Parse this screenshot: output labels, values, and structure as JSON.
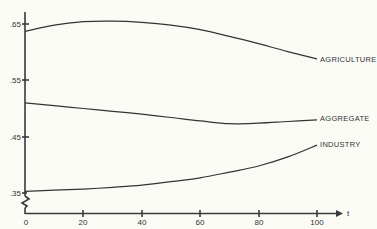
{
  "chart_data": {
    "type": "line",
    "title": "",
    "xlabel": "t",
    "ylabel": "",
    "xlim": [
      0,
      100
    ],
    "ylim": [
      0.35,
      0.67
    ],
    "y_axis_break": true,
    "grid": false,
    "legend": "inline labels at right end of each line",
    "x_ticks": [
      0,
      20,
      40,
      60,
      80,
      100
    ],
    "x_tick_labels": [
      "0",
      "20",
      "40",
      "60",
      "80",
      "100"
    ],
    "y_ticks": [
      0.35,
      0.45,
      0.55,
      0.65
    ],
    "y_tick_labels": [
      ".35",
      ".45",
      ".55",
      ".65"
    ],
    "x": [
      0,
      10,
      20,
      30,
      40,
      50,
      60,
      70,
      80,
      90,
      100
    ],
    "series": [
      {
        "name": "AGRICULTURE",
        "values": [
          0.637,
          0.648,
          0.654,
          0.655,
          0.653,
          0.648,
          0.64,
          0.628,
          0.615,
          0.601,
          0.588
        ]
      },
      {
        "name": "AGGREGATE",
        "values": [
          0.51,
          0.505,
          0.5,
          0.495,
          0.49,
          0.484,
          0.478,
          0.473,
          0.474,
          0.477,
          0.48
        ]
      },
      {
        "name": "INDUSTRY",
        "values": [
          0.353,
          0.355,
          0.357,
          0.36,
          0.364,
          0.37,
          0.377,
          0.387,
          0.398,
          0.414,
          0.435
        ]
      }
    ]
  },
  "axes": {
    "x_axis_label": "t",
    "x_tick_labels": [
      "0",
      "20",
      "40",
      "60",
      "80",
      "100"
    ],
    "y_tick_labels": [
      ".65",
      ".55",
      ".45",
      ".35"
    ]
  },
  "labels": {
    "agriculture": "AGRICULTURE",
    "aggregate": "AGGREGATE",
    "industry": "INDUSTRY"
  }
}
